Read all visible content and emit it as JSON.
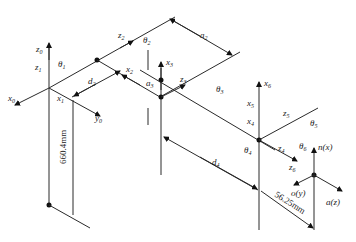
{
  "diagram": {
    "frames": {
      "z0": "z",
      "z0_sub": "0",
      "z1": "z",
      "z1_sub": "1",
      "theta1": "θ",
      "theta1_sub": "1",
      "x0": "x",
      "x0_sub": "0",
      "x1": "x",
      "x1_sub": "1",
      "y0": "y",
      "y0_sub": "0",
      "d2": "d",
      "d2_sub": "2",
      "z2": "z",
      "z2_sub": "2",
      "theta2": "θ",
      "theta2_sub": "2",
      "x2": "x",
      "x2_sub": "2",
      "a2": "a",
      "a2_sub": "2",
      "x3": "x",
      "x3_sub": "3",
      "a3": "a",
      "a3_sub": "3",
      "z3": "z",
      "z3_sub": "3",
      "theta3": "θ",
      "theta3_sub": "3",
      "x6": "x",
      "x6_sub": "6",
      "x5": "x",
      "x5_sub": "5",
      "x4": "x",
      "x4_sub": "4",
      "theta4": "θ",
      "theta4_sub": "4",
      "z5": "z",
      "z5_sub": "5",
      "theta5": "θ",
      "theta5_sub": "5",
      "z4": "z",
      "z4_sub": "4",
      "theta6": "θ",
      "theta6_sub": "6",
      "z6": "z",
      "z6_sub": "6",
      "d4": "d",
      "d4_sub": "4",
      "n": "n(x)",
      "o": "o(y)",
      "a": "a(z)"
    },
    "dimensions": {
      "base_height": "660.4mm",
      "tool_offset": "56.25mm"
    }
  }
}
